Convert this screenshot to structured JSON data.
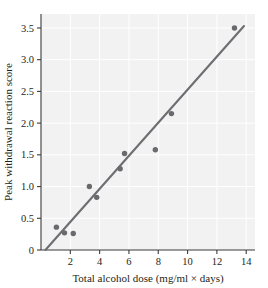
{
  "chart_data": {
    "type": "scatter",
    "title": "",
    "xlabel": "Total alcohol dose (mg/ml × days)",
    "ylabel": "Peak withdrawal reaction score",
    "xlim": [
      0,
      14.6
    ],
    "ylim": [
      0,
      3.72
    ],
    "xticks": [
      2,
      4,
      6,
      8,
      10,
      12,
      14
    ],
    "xtick_labels": [
      "2",
      "4",
      "6",
      "8",
      "10",
      "12",
      "14"
    ],
    "yticks": [
      0,
      0.5,
      1.0,
      1.5,
      2.0,
      2.5,
      3.0,
      3.5
    ],
    "ytick_labels": [
      "0",
      "0.5",
      "1.0",
      "1.5",
      "2.0",
      "2.5",
      "3.0",
      "3.5"
    ],
    "grid": true,
    "legend": null,
    "series": [
      {
        "name": "observations",
        "marker": "circle",
        "color": "#6a6a6e",
        "points": [
          {
            "x": 1.05,
            "y": 0.36
          },
          {
            "x": 1.6,
            "y": 0.27
          },
          {
            "x": 2.2,
            "y": 0.26
          },
          {
            "x": 3.3,
            "y": 1.0
          },
          {
            "x": 3.8,
            "y": 0.83
          },
          {
            "x": 5.4,
            "y": 1.28
          },
          {
            "x": 5.7,
            "y": 1.52
          },
          {
            "x": 7.8,
            "y": 1.58
          },
          {
            "x": 8.9,
            "y": 2.15
          },
          {
            "x": 13.2,
            "y": 3.5
          }
        ]
      }
    ],
    "fit_line": {
      "name": "regression-line",
      "color": "#6e6e72",
      "x_start": 0.3,
      "y_start": 0.0,
      "x_end": 13.85,
      "y_end": 3.53
    }
  },
  "axis": {
    "x_title": "Total alcohol dose (mg/ml × days)",
    "y_title": "Peak withdrawal reaction score"
  },
  "colors": {
    "marker": "#6a6a6e",
    "line": "#6e6e72",
    "axis": "#3b3b3b",
    "plot_background": "#f2f2f2",
    "figure_background": "#ffffff",
    "text": "#231f20"
  }
}
